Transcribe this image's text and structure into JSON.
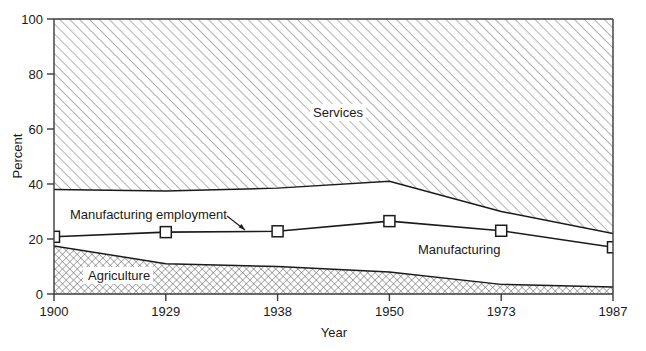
{
  "chart_data": {
    "type": "area",
    "title": "",
    "xlabel": "Year",
    "ylabel": "Percent",
    "categories": [
      "1900",
      "1929",
      "1938",
      "1950",
      "1973",
      "1987"
    ],
    "ylim": [
      0,
      100
    ],
    "yticks": [
      0,
      20,
      40,
      60,
      80,
      100
    ],
    "ytick_labels": [
      "0",
      "20",
      "40",
      "60",
      "80",
      "100"
    ],
    "grid": false,
    "legend_position": "inline-annotations",
    "series": [
      {
        "name": "Agriculture",
        "kind": "area",
        "fill": "crosshatch",
        "values": [
          17.5,
          11.0,
          10.0,
          8.0,
          3.5,
          2.5
        ]
      },
      {
        "name": "Manufacturing",
        "kind": "band",
        "fill": "none",
        "note": "region between Agriculture top and Services lower boundary",
        "lower": [
          17.5,
          11.0,
          10.0,
          8.0,
          3.5,
          2.5
        ],
        "upper": [
          38.0,
          37.5,
          38.5,
          41.0,
          30.0,
          22.0
        ]
      },
      {
        "name": "Services",
        "kind": "area",
        "fill": "diagonal-hatch",
        "lower": [
          38.0,
          37.5,
          38.5,
          41.0,
          30.0,
          22.0
        ],
        "upper": [
          100,
          100,
          100,
          100,
          100,
          100
        ]
      },
      {
        "name": "Manufacturing employment",
        "kind": "line-markers",
        "marker": "open-square",
        "values": [
          20.8,
          22.5,
          22.8,
          26.5,
          23.0,
          17.0
        ]
      }
    ],
    "annotations": [
      {
        "text": "Services",
        "x_category": "1938",
        "y": 64
      },
      {
        "text": "Manufacturing",
        "x_category": "1950",
        "y": 20
      },
      {
        "text": "Agriculture",
        "x_category": "1900",
        "y": 6
      },
      {
        "text": "Manufacturing employment",
        "x_category": "1900",
        "y": 29,
        "callout": true
      }
    ]
  },
  "axis": {
    "y_title": "Percent",
    "x_title": "Year",
    "y_ticks": [
      "0",
      "20",
      "40",
      "60",
      "80",
      "100"
    ],
    "x_ticks": [
      "1900",
      "1929",
      "1938",
      "1950",
      "1973",
      "1987"
    ]
  },
  "labels": {
    "services": "Services",
    "manufacturing": "Manufacturing",
    "agriculture": "Agriculture",
    "manufacturing_employment": "Manufacturing employment"
  },
  "colors": {
    "ink": "#1a1a1a",
    "hatch": "#555555",
    "background": "#ffffff"
  }
}
